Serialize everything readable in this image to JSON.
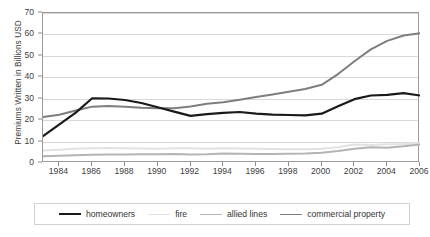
{
  "chart_data": {
    "type": "line",
    "title": "",
    "xlabel": "",
    "ylabel": "Premiums Written in Billions USD",
    "x": [
      1983,
      1984,
      1985,
      1986,
      1987,
      1988,
      1989,
      1990,
      1991,
      1992,
      1993,
      1994,
      1995,
      1996,
      1997,
      1998,
      1999,
      2000,
      2001,
      2002,
      2003,
      2004,
      2005,
      2006
    ],
    "xlim": [
      1983,
      2006
    ],
    "ylim": [
      0,
      70
    ],
    "yticks": [
      0,
      10,
      20,
      30,
      40,
      50,
      60,
      70
    ],
    "xticks": [
      1984,
      1986,
      1988,
      1990,
      1992,
      1994,
      1996,
      1998,
      2000,
      2002,
      2004,
      2006
    ],
    "grid": true,
    "legend_position": "bottom",
    "series": [
      {
        "name": "homeowners",
        "color": "#1a1a1a",
        "width": 2.2,
        "values": [
          12.5,
          18.0,
          23.5,
          30.2,
          30.1,
          29.4,
          28.0,
          26.0,
          24.0,
          22.0,
          22.8,
          23.4,
          23.8,
          23.0,
          22.6,
          22.4,
          22.2,
          23.0,
          26.5,
          29.8,
          31.5,
          31.8,
          32.6,
          31.5
        ]
      },
      {
        "name": "fire",
        "color": "#e2e2e2",
        "width": 2.0,
        "values": [
          5.8,
          6.2,
          6.6,
          6.9,
          7.0,
          6.9,
          6.8,
          6.7,
          6.9,
          6.9,
          6.7,
          6.9,
          6.8,
          6.6,
          6.5,
          6.4,
          6.4,
          6.6,
          7.4,
          8.6,
          8.4,
          8.8,
          8.7,
          9.4
        ]
      },
      {
        "name": "allied lines",
        "color": "#b4b4b4",
        "width": 2.0,
        "values": [
          3.2,
          3.4,
          3.6,
          3.9,
          4.0,
          4.0,
          4.1,
          4.1,
          4.2,
          4.0,
          4.1,
          4.4,
          4.3,
          4.2,
          4.2,
          4.3,
          4.4,
          4.8,
          5.6,
          6.6,
          7.3,
          7.1,
          7.8,
          8.6
        ]
      },
      {
        "name": "commercial property",
        "color": "#7e7e7e",
        "width": 2.0,
        "values": [
          21.5,
          22.5,
          24.5,
          26.3,
          26.6,
          26.3,
          25.8,
          25.5,
          25.6,
          26.4,
          27.6,
          28.3,
          29.5,
          30.8,
          32.0,
          33.2,
          34.5,
          36.5,
          41.5,
          47.5,
          53.0,
          57.0,
          59.5,
          60.5
        ]
      }
    ]
  },
  "legend": {
    "items": [
      {
        "label": "homeowners"
      },
      {
        "label": "fire"
      },
      {
        "label": "allied lines"
      },
      {
        "label": "commercial property"
      }
    ]
  }
}
